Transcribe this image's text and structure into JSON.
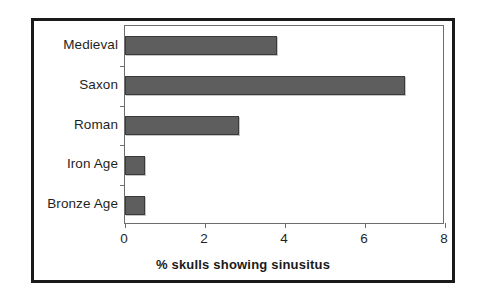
{
  "chart_data": {
    "type": "bar",
    "orientation": "horizontal",
    "title": "",
    "xlabel": "% skulls showing sinusitus",
    "ylabel": "",
    "categories": [
      "Bronze Age",
      "Iron Age",
      "Roman",
      "Saxon",
      "Medieval"
    ],
    "values": [
      0.5,
      0.5,
      2.85,
      7.0,
      3.8
    ],
    "series": [
      {
        "name": "% skulls showing sinusitus",
        "values": [
          0.5,
          0.5,
          2.85,
          7.0,
          3.8
        ]
      }
    ],
    "xlim": [
      0,
      8
    ],
    "xticks": [
      0,
      2,
      4,
      6,
      8
    ],
    "xtick_labels": [
      "0",
      "2",
      "4",
      "6",
      "8"
    ],
    "grid": false,
    "legend": false,
    "bar_color": "#5e5e5e",
    "bar_edge_color": "#3b3b3b",
    "plot_border_color": "#6d6d6d",
    "frame_color": "#1a1a1a",
    "background": "#ffffff"
  },
  "axis": {
    "x_title": "% skulls showing sinusitus",
    "tick_labels": [
      "0",
      "2",
      "4",
      "6",
      "8"
    ]
  },
  "categories": [
    {
      "label": "Medieval",
      "value": 3.8
    },
    {
      "label": "Saxon",
      "value": 7.0
    },
    {
      "label": "Roman",
      "value": 2.85
    },
    {
      "label": "Iron Age",
      "value": 0.5
    },
    {
      "label": "Bronze Age",
      "value": 0.5
    }
  ]
}
